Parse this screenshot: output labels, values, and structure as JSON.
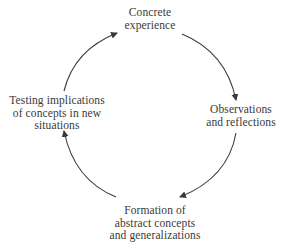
{
  "diagram": {
    "type": "cycle",
    "title": "",
    "direction": "clockwise",
    "stages": [
      {
        "id": "concrete",
        "lines": [
          "Concrete",
          "experience"
        ]
      },
      {
        "id": "observations",
        "lines": [
          "Observations",
          "and reflections"
        ]
      },
      {
        "id": "formation",
        "lines": [
          "Formation of",
          "abstract concepts",
          "and generalizations"
        ]
      },
      {
        "id": "testing",
        "lines": [
          "Testing implications",
          "of concepts in new",
          "situations"
        ]
      }
    ],
    "edges": [
      {
        "from": "concrete",
        "to": "observations"
      },
      {
        "from": "observations",
        "to": "formation"
      },
      {
        "from": "formation",
        "to": "testing"
      },
      {
        "from": "testing",
        "to": "concrete"
      }
    ],
    "colors": {
      "background": "#ffffff",
      "text": "#3a3a3a",
      "arrow": "#3a3a3a"
    }
  }
}
